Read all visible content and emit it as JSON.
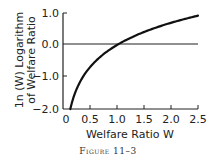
{
  "chart_data": {
    "type": "line",
    "title": "",
    "caption": "Figure 11–3",
    "xlabel": "Welfare Ratio W",
    "ylabel_line1": "1n (W) Logarithm",
    "ylabel_line2": "of Welfare Ratio",
    "xlim": [
      0,
      2.5
    ],
    "ylim": [
      -2.0,
      1.0
    ],
    "x_ticks": [
      "0",
      "0.5",
      "1.0",
      "1.5",
      "2.0",
      "2.5"
    ],
    "y_ticks": [
      "1.0",
      "0.0",
      "−1.0",
      "−2.0"
    ],
    "reference_line": {
      "y": 0.0
    },
    "grid": false,
    "series": [
      {
        "name": "ln(W)",
        "function": "ln(W)",
        "x": [
          0.135,
          0.2,
          0.3,
          0.4,
          0.5,
          0.6,
          0.7,
          0.8,
          0.9,
          1.0,
          1.25,
          1.5,
          1.75,
          2.0,
          2.25,
          2.5
        ],
        "values": [
          -2.0,
          -1.61,
          -1.2,
          -0.92,
          -0.69,
          -0.51,
          -0.36,
          -0.22,
          -0.11,
          0.0,
          0.22,
          0.41,
          0.56,
          0.69,
          0.81,
          0.92
        ]
      }
    ]
  },
  "colors": {
    "line": "#111111",
    "axis": "#222222",
    "text": "#222222"
  }
}
